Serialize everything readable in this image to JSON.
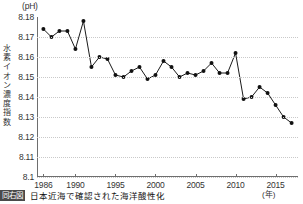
{
  "axis": {
    "unit_label": "(pH)",
    "y_title_chars": [
      "水",
      "素",
      "イ",
      "オ",
      "ン",
      "濃",
      "度",
      "指",
      "数"
    ],
    "x_unit_label": "(年)"
  },
  "caption": {
    "badge": "同右図",
    "text": "日本近海で確認された海洋酸性化"
  },
  "chart_data": {
    "type": "line",
    "title": "日本近海で確認された海洋酸性化",
    "xlabel": "(年)",
    "ylabel": "水素イオン濃度指数",
    "unit": "pH",
    "grid": true,
    "legend": "none",
    "marker": "filled-circle",
    "xlim": [
      1985.2,
      2017.8
    ],
    "ylim": [
      8.1,
      8.18
    ],
    "ytick_labels": [
      "8.18",
      "8.17",
      "8.16",
      "8.15",
      "8.14",
      "8.13",
      "8.12",
      "8.11",
      "8.1"
    ],
    "ytick_values": [
      8.18,
      8.17,
      8.16,
      8.15,
      8.14,
      8.13,
      8.12,
      8.11,
      8.1
    ],
    "xtick_labels": [
      "1986",
      "1990",
      "1995",
      "2000",
      "2005",
      "2010",
      "2015"
    ],
    "xtick_values": [
      1986,
      1990,
      1995,
      2000,
      2005,
      2010,
      2015
    ],
    "x": [
      1986,
      1987,
      1988,
      1989,
      1990,
      1991,
      1992,
      1993,
      1994,
      1995,
      1996,
      1997,
      1998,
      1999,
      2000,
      2001,
      2002,
      2003,
      2004,
      2005,
      2006,
      2007,
      2008,
      2009,
      2010,
      2011,
      2012,
      2013,
      2014,
      2015,
      2016,
      2017
    ],
    "values": [
      8.174,
      8.17,
      8.173,
      8.173,
      8.164,
      8.178,
      8.155,
      8.16,
      8.159,
      8.151,
      8.15,
      8.153,
      8.155,
      8.149,
      8.151,
      8.158,
      8.155,
      8.15,
      8.152,
      8.151,
      8.153,
      8.157,
      8.152,
      8.152,
      8.162,
      8.139,
      8.14,
      8.145,
      8.142,
      8.136,
      8.13,
      8.127
    ],
    "series": [
      {
        "name": "水素イオン濃度指数",
        "values": [
          8.174,
          8.17,
          8.173,
          8.173,
          8.164,
          8.178,
          8.155,
          8.16,
          8.159,
          8.151,
          8.15,
          8.153,
          8.155,
          8.149,
          8.151,
          8.158,
          8.155,
          8.15,
          8.152,
          8.151,
          8.153,
          8.157,
          8.152,
          8.152,
          8.162,
          8.139,
          8.14,
          8.145,
          8.142,
          8.136,
          8.13,
          8.127
        ]
      }
    ],
    "trend": "decreasing",
    "line_color": "#1a1a1a",
    "marker_color": "#111111",
    "grid_color": "#c9c9c9"
  }
}
